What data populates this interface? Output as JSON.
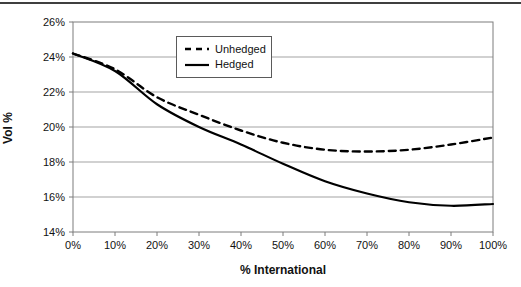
{
  "page": {
    "top_rule_present": true
  },
  "chart_data": {
    "type": "line",
    "x": [
      0,
      10,
      20,
      30,
      40,
      50,
      60,
      70,
      80,
      90,
      100
    ],
    "x_tick_labels": [
      "0%",
      "10%",
      "20%",
      "30%",
      "40%",
      "50%",
      "60%",
      "70%",
      "80%",
      "90%",
      "100%"
    ],
    "y_ticks": [
      14,
      16,
      18,
      20,
      22,
      24,
      26
    ],
    "y_tick_labels": [
      "14%",
      "16%",
      "18%",
      "20%",
      "22%",
      "24%",
      "26%"
    ],
    "ylim": [
      14,
      26
    ],
    "xlabel": "% International",
    "ylabel": "Vol %",
    "grid": "horizontal",
    "legend_position": "top-center",
    "series": [
      {
        "name": "Unhedged",
        "style": "dashed",
        "values": [
          24.2,
          23.3,
          21.7,
          20.7,
          19.8,
          19.1,
          18.7,
          18.6,
          18.7,
          19.0,
          19.4
        ]
      },
      {
        "name": "Hedged",
        "style": "solid",
        "values": [
          24.2,
          23.2,
          21.3,
          20.0,
          19.0,
          17.9,
          16.9,
          16.2,
          15.7,
          15.5,
          15.6
        ]
      }
    ],
    "colors": {
      "line": "#000000",
      "grid": "#a3a3a3",
      "plot_border": "#7d7d7d",
      "text": "#111111",
      "background": "#ffffff"
    }
  }
}
